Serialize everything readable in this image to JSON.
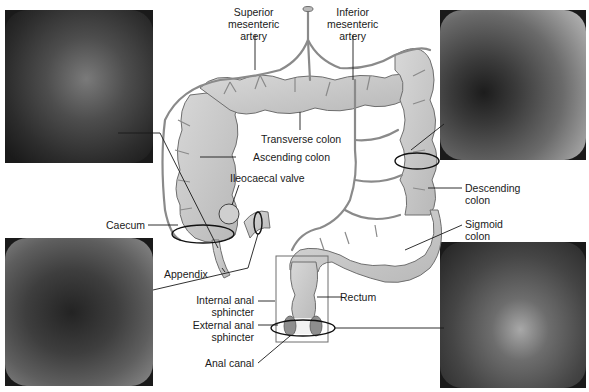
{
  "diagram": {
    "labels": {
      "superior_mesenteric_artery": "Superior mesenteric artery",
      "superior_line1": "Superior",
      "superior_line2": "mesenteric",
      "superior_line3": "artery",
      "inferior_line1": "Inferior",
      "inferior_line2": "mesenteric",
      "inferior_line3": "artery",
      "transverse_colon": "Transverse colon",
      "ascending_colon": "Ascending colon",
      "ileocaecal_valve": "Ileocaecal valve",
      "caecum": "Caecum",
      "appendix": "Appendix",
      "descending_line1": "Descending",
      "descending_line2": "colon",
      "sigmoid_line1": "Sigmoid",
      "sigmoid_line2": "colon",
      "rectum": "Rectum",
      "internal_line1": "Internal anal",
      "internal_line2": "sphincter",
      "external_line1": "External anal",
      "external_line2": "sphincter",
      "anal_canal": "Anal canal"
    },
    "photos": [
      {
        "position": "top-left",
        "depicts": "endoscopic view of ascending colon"
      },
      {
        "position": "top-right",
        "depicts": "endoscopic view of descending colon"
      },
      {
        "position": "bottom-left",
        "depicts": "endoscopic view of caecum"
      },
      {
        "position": "bottom-right",
        "depicts": "endoscopic view of anal canal"
      }
    ],
    "colors": {
      "colon_fill": "#c9c9c9",
      "colon_stroke": "#6e6e6e",
      "vessel": "#8a8a8a",
      "leader_line": "#1a1a1a",
      "background": "#ffffff"
    }
  }
}
